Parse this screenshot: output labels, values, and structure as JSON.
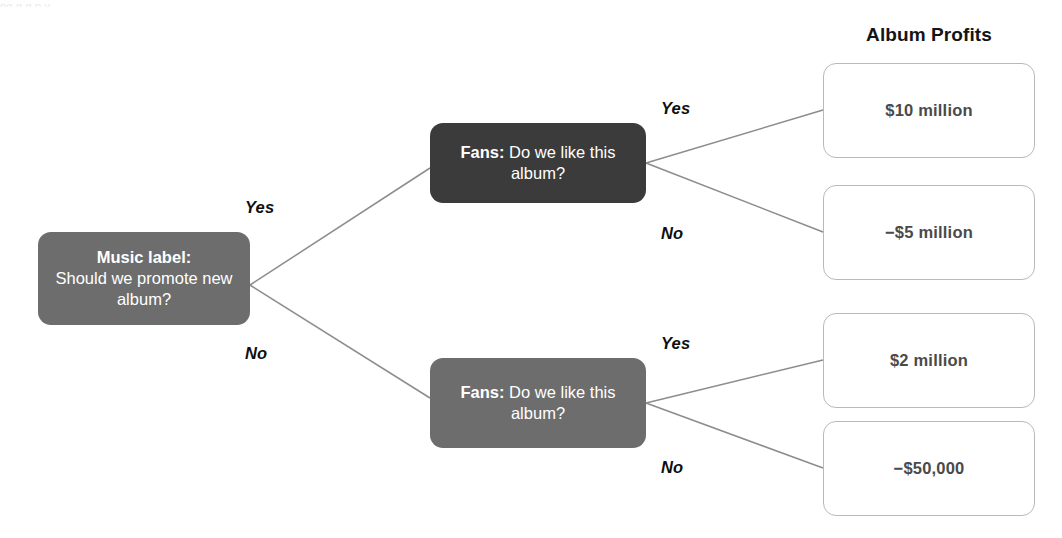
{
  "diagram": {
    "type": "decision-tree",
    "top_remnant": "ng                    p                      g              p y",
    "heading": "Album Profits",
    "colors": {
      "root_node": "#6d6d6d",
      "dark_node": "#3b3b3b",
      "outcome_border": "#b9b9bc",
      "outcome_text": "#4a4a4a",
      "wire": "#8c8c8c",
      "label_text": "#0f0f0f"
    },
    "nodes": {
      "root": {
        "lead": "Music label:",
        "text": "Should we promote new album?"
      },
      "fans_top": {
        "lead": "Fans:",
        "text": "Do we like this album?"
      },
      "fans_bottom": {
        "lead": "Fans:",
        "text": "Do we like this album?"
      }
    },
    "branch_labels": {
      "root_yes": "Yes",
      "root_no": "No",
      "top_yes": "Yes",
      "top_no": "No",
      "bottom_yes": "Yes",
      "bottom_no": "No"
    },
    "outcomes": [
      {
        "id": "outcome-1",
        "value": "$10 million"
      },
      {
        "id": "outcome-2",
        "value": "−$5 million"
      },
      {
        "id": "outcome-3",
        "value": "$2 million"
      },
      {
        "id": "outcome-4",
        "value": "−$50,000"
      }
    ]
  }
}
